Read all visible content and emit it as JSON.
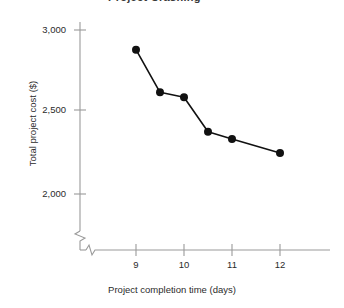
{
  "figure": {
    "clipped_title": "Project Crashing",
    "axes": {
      "x_title": "Project completion time (days)",
      "y_title": "Total project cost ($)"
    }
  },
  "chart_data": {
    "type": "line",
    "title": "Project Crashing",
    "xlabel": "Project completion time (days)",
    "ylabel": "Total project cost ($)",
    "x": [
      9,
      9.5,
      10,
      10.5,
      11,
      12
    ],
    "values": [
      2880,
      2620,
      2590,
      2380,
      2335,
      2250
    ],
    "series": [
      {
        "name": "Total project cost",
        "x": [
          9,
          9.5,
          10,
          10.5,
          11,
          12
        ],
        "values": [
          2880,
          2620,
          2590,
          2380,
          2335,
          2250
        ]
      }
    ],
    "xlim": [
      8.5,
      12.6
    ],
    "ylim": [
      1950,
      3050
    ],
    "x_ticks": [
      9,
      10,
      11,
      12
    ],
    "x_tick_labels": [
      "9",
      "10",
      "11",
      "12"
    ],
    "y_ticks": [
      2000,
      2500,
      3000
    ],
    "y_tick_labels": [
      "2,000",
      "2,500",
      "3,000"
    ],
    "grid": false,
    "legend": "none",
    "axis_break": {
      "y_axis": true,
      "x_axis": true,
      "note": "zigzag break marks near origin on both axes"
    },
    "marker": "filled-circle",
    "marker_color": "#111111",
    "line_color": "#111111"
  },
  "colors": {
    "line": "#111111",
    "marker": "#111111",
    "axis": "#8c8c8c",
    "text": "#2b2b2b",
    "background": "#ffffff"
  }
}
